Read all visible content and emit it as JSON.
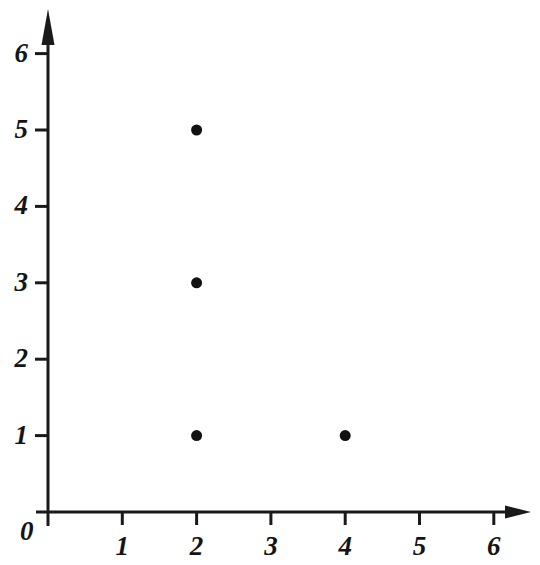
{
  "chart_data": {
    "type": "scatter",
    "title": "",
    "xlabel": "",
    "ylabel": "",
    "xlim": [
      0,
      6.5
    ],
    "ylim": [
      0,
      6.6
    ],
    "grid": false,
    "legend": false,
    "marker": {
      "shape": "filled-circle",
      "color": "#111111",
      "size_px": 11
    },
    "axis": {
      "color": "#1a1a1a",
      "arrowheads": [
        "x-axis-right",
        "y-axis-top"
      ],
      "tick_direction": {
        "x": "down",
        "y": "left"
      }
    },
    "x_ticks": [
      {
        "value": 0,
        "label": "0"
      },
      {
        "value": 1,
        "label": "1"
      },
      {
        "value": 2,
        "label": "2"
      },
      {
        "value": 3,
        "label": "3"
      },
      {
        "value": 4,
        "label": "4"
      },
      {
        "value": 5,
        "label": "5"
      },
      {
        "value": 6,
        "label": "6"
      }
    ],
    "y_ticks": [
      {
        "value": 1,
        "label": "1"
      },
      {
        "value": 2,
        "label": "2"
      },
      {
        "value": 3,
        "label": "3"
      },
      {
        "value": 4,
        "label": "4"
      },
      {
        "value": 5,
        "label": "5"
      },
      {
        "value": 6,
        "label": "6"
      }
    ],
    "origin_label": "0",
    "points": [
      {
        "x": 2,
        "y": 5
      },
      {
        "x": 2,
        "y": 3
      },
      {
        "x": 2,
        "y": 1
      },
      {
        "x": 4,
        "y": 1
      }
    ]
  }
}
